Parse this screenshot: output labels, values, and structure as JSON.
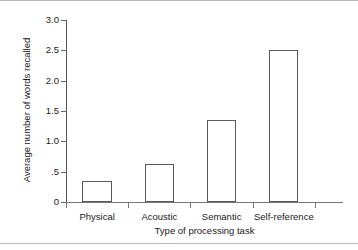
{
  "chart_data": {
    "type": "bar",
    "title": "",
    "subtitle": "",
    "xlabel": "Type of processing task",
    "ylabel": "Average number of words recalled",
    "categories": [
      "Physical",
      "Acoustic",
      "Semantic",
      "Self-reference"
    ],
    "values": [
      0.35,
      0.63,
      1.35,
      2.5
    ],
    "series": [
      {
        "name": "Average number of words recalled",
        "values": [
          0.35,
          0.63,
          1.35,
          2.5
        ]
      }
    ],
    "ylim": [
      0,
      3.0
    ],
    "ytick_values": [
      3.0,
      2.5,
      2.0,
      1.5,
      1.0,
      0.5,
      0
    ],
    "ytick_labels": [
      "3.0",
      "2.5",
      "2.0",
      "1.5",
      "1.0",
      ".5",
      "0"
    ],
    "grid": false,
    "legend": false,
    "legend_position": "none",
    "bar_fill_color": "#ffffff",
    "bar_edge_color": "#5a5a5a",
    "axis_color": "#666666",
    "background_color": "#ffffff",
    "text_color": "#1a1a1a"
  }
}
